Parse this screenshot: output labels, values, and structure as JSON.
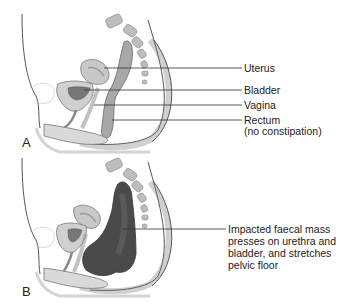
{
  "diagram": {
    "type": "anatomical-sagittal-section",
    "panels": [
      {
        "id": "A",
        "letter": "A",
        "labels": [
          {
            "text": "Uterus"
          },
          {
            "text": "Bladder"
          },
          {
            "text": "Vagina"
          },
          {
            "text": "Rectum",
            "subtext": "(no constipation)"
          }
        ]
      },
      {
        "id": "B",
        "letter": "B",
        "labels": [
          {
            "lines": [
              "Impacted faecal mass",
              "presses on urethra and",
              "bladder, and stretches",
              "pelvic floor"
            ]
          }
        ]
      }
    ],
    "colors": {
      "outline": "#555555",
      "tissue_light": "#d9d9d9",
      "tissue_mid": "#a8a8a8",
      "faecal_mass": "#4a4a4a",
      "leader_line": "#333333"
    }
  }
}
